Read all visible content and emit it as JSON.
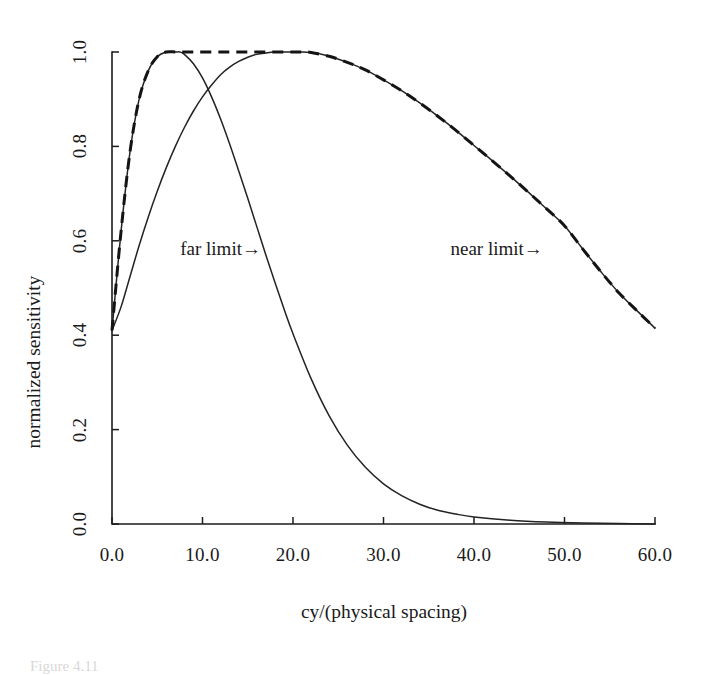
{
  "figure": {
    "caption_fragment": "Figure 4.11"
  },
  "chart_data": {
    "type": "line",
    "title": "",
    "xlabel": "cy/(physical spacing)",
    "ylabel": "normalized sensitivity",
    "xlim": [
      0.0,
      60.0
    ],
    "ylim": [
      0.0,
      1.0
    ],
    "grid": false,
    "legend_position": "none",
    "xticks": [
      "0.0",
      "10.0",
      "20.0",
      "30.0",
      "40.0",
      "50.0",
      "60.0"
    ],
    "xtick_values": [
      0.0,
      10.0,
      20.0,
      30.0,
      40.0,
      50.0,
      60.0
    ],
    "yticks": [
      "0.0",
      "0.2",
      "0.4",
      "0.6",
      "0.8",
      "1.0"
    ],
    "ytick_values": [
      0.0,
      0.2,
      0.4,
      0.6,
      0.8,
      1.0
    ],
    "annotations": [
      {
        "text": "far limit→",
        "x": 12.0,
        "y": 0.58
      },
      {
        "text": "near limit→",
        "x": 42.5,
        "y": 0.58
      }
    ],
    "series": [
      {
        "name": "far limit",
        "style": "solid",
        "peak_x": 7.5,
        "peak_y": 1.0,
        "x": [
          0.0,
          1.0,
          2.0,
          3.0,
          4.0,
          5.0,
          6.0,
          7.0,
          7.5,
          8.0,
          9.0,
          10.0,
          11.0,
          12.0,
          13.0,
          14.0,
          15.0,
          16.0,
          17.0,
          18.0,
          19.0,
          20.0,
          22.0,
          24.0,
          26.0,
          28.0,
          30.0,
          32.0,
          34.0,
          36.0,
          38.0,
          40.0,
          44.0,
          48.0,
          52.0,
          56.0,
          60.0
        ],
        "y": [
          0.41,
          0.62,
          0.79,
          0.9,
          0.96,
          0.99,
          1.0,
          1.0,
          1.0,
          0.995,
          0.975,
          0.945,
          0.905,
          0.858,
          0.805,
          0.748,
          0.69,
          0.63,
          0.57,
          0.512,
          0.456,
          0.403,
          0.308,
          0.229,
          0.167,
          0.12,
          0.085,
          0.06,
          0.042,
          0.029,
          0.021,
          0.015,
          0.008,
          0.004,
          0.002,
          0.001,
          0.0
        ]
      },
      {
        "name": "near limit",
        "style": "solid",
        "peak_x": 21.0,
        "peak_y": 1.0,
        "x": [
          0.0,
          1.0,
          2.0,
          3.0,
          4.0,
          5.0,
          6.0,
          7.0,
          8.0,
          9.0,
          10.0,
          11.0,
          12.0,
          13.0,
          14.0,
          15.0,
          16.0,
          17.0,
          18.0,
          19.0,
          20.0,
          21.0,
          22.0,
          23.0,
          24.0,
          26.0,
          28.0,
          30.0,
          32.0,
          34.0,
          36.0,
          38.0,
          40.0,
          42.0,
          44.0,
          46.0,
          48.0,
          50.0,
          52.0,
          54.0,
          56.0,
          58.0,
          60.0
        ],
        "y": [
          0.41,
          0.46,
          0.525,
          0.59,
          0.65,
          0.705,
          0.755,
          0.8,
          0.84,
          0.875,
          0.905,
          0.93,
          0.952,
          0.968,
          0.98,
          0.989,
          0.995,
          0.998,
          1.0,
          1.0,
          1.0,
          1.0,
          0.999,
          0.996,
          0.991,
          0.978,
          0.962,
          0.941,
          0.918,
          0.892,
          0.864,
          0.834,
          0.802,
          0.77,
          0.737,
          0.703,
          0.668,
          0.632,
          0.583,
          0.535,
          0.49,
          0.452,
          0.415
        ]
      },
      {
        "name": "envelope",
        "style": "dashed",
        "description": "maximum of far limit and near limit",
        "x": [
          0.0,
          1.0,
          2.0,
          3.0,
          4.0,
          5.0,
          6.0,
          7.0,
          7.5,
          8.0,
          9.0,
          10.0,
          12.0,
          14.0,
          16.0,
          18.0,
          20.0,
          21.0,
          22.0,
          24.0,
          26.0,
          28.0,
          30.0,
          32.0,
          34.0,
          36.0,
          38.0,
          40.0,
          42.0,
          44.0,
          46.0,
          48.0,
          50.0,
          52.0,
          54.0,
          56.0,
          58.0,
          60.0
        ],
        "y": [
          0.41,
          0.62,
          0.79,
          0.9,
          0.96,
          0.99,
          1.0,
          1.0,
          1.0,
          1.0,
          1.0,
          1.0,
          1.0,
          1.0,
          1.0,
          1.0,
          1.0,
          1.0,
          0.999,
          0.991,
          0.978,
          0.962,
          0.941,
          0.918,
          0.892,
          0.864,
          0.834,
          0.802,
          0.77,
          0.737,
          0.703,
          0.668,
          0.632,
          0.583,
          0.535,
          0.49,
          0.452,
          0.415
        ]
      }
    ]
  }
}
